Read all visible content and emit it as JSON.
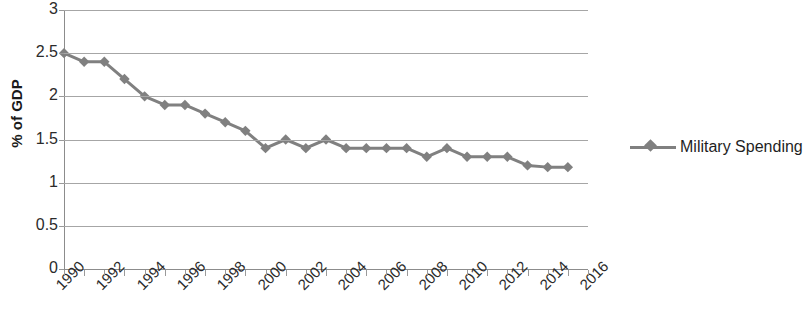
{
  "chart_data": {
    "type": "line",
    "title": "",
    "xlabel": "",
    "ylabel": "% of GDP",
    "ylim": [
      0,
      3
    ],
    "xlim": [
      1990,
      2016
    ],
    "grid": true,
    "legend_position": "right",
    "y_ticks": [
      "0",
      "0.5",
      "1",
      "1.5",
      "2",
      "2.5",
      "3"
    ],
    "y_tick_values": [
      0,
      0.5,
      1,
      1.5,
      2,
      2.5,
      3
    ],
    "x_tick_labels": [
      "1990",
      "1992",
      "1994",
      "1996",
      "1998",
      "2000",
      "2002",
      "2004",
      "2006",
      "2008",
      "2010",
      "2012",
      "2014",
      "2016"
    ],
    "series": [
      {
        "name": "Military Spending",
        "color": "#808080",
        "marker": "diamond",
        "x": [
          1990,
          1991,
          1992,
          1993,
          1994,
          1995,
          1996,
          1997,
          1998,
          1999,
          2000,
          2001,
          2002,
          2003,
          2004,
          2005,
          2006,
          2007,
          2008,
          2009,
          2010,
          2011,
          2012,
          2013,
          2014,
          2015
        ],
        "values": [
          2.5,
          2.4,
          2.4,
          2.2,
          2.0,
          1.9,
          1.9,
          1.8,
          1.7,
          1.6,
          1.4,
          1.5,
          1.4,
          1.5,
          1.4,
          1.4,
          1.4,
          1.4,
          1.3,
          1.4,
          1.3,
          1.3,
          1.3,
          1.2,
          1.18,
          1.18
        ]
      }
    ]
  },
  "legend": {
    "entries": [
      {
        "label": "Military Spending"
      }
    ]
  },
  "axis": {
    "y_title": "% of GDP"
  }
}
